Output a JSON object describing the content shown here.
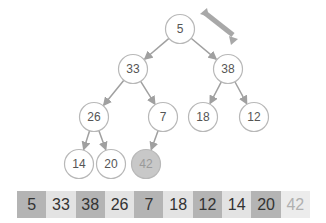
{
  "diagram": {
    "type": "binary-heap",
    "colors": {
      "edge": "#a0a0a0",
      "node_border": "#b8b8b8",
      "node_fill": "#ffffff",
      "highlight_fill": "#c8c8c8",
      "swap_arrow": "#a8a8a8",
      "cell_dark": "#b4b4b4",
      "cell_light": "#e3e3e3",
      "cell_faint": "#ececec"
    },
    "nodes": [
      {
        "id": "n0",
        "value": "5",
        "cx": 180,
        "cy": 29,
        "highlight": false
      },
      {
        "id": "n1",
        "value": "33",
        "cx": 133,
        "cy": 69,
        "highlight": false
      },
      {
        "id": "n2",
        "value": "38",
        "cx": 228,
        "cy": 69,
        "highlight": false
      },
      {
        "id": "n3",
        "value": "26",
        "cx": 94,
        "cy": 117,
        "highlight": false
      },
      {
        "id": "n4",
        "value": "7",
        "cx": 163,
        "cy": 117,
        "highlight": false
      },
      {
        "id": "n5",
        "value": "18",
        "cx": 203,
        "cy": 117,
        "highlight": false
      },
      {
        "id": "n6",
        "value": "12",
        "cx": 254,
        "cy": 117,
        "highlight": false
      },
      {
        "id": "n7",
        "value": "14",
        "cx": 79,
        "cy": 164,
        "highlight": false
      },
      {
        "id": "n8",
        "value": "20",
        "cx": 111,
        "cy": 164,
        "highlight": false
      },
      {
        "id": "n9",
        "value": "42",
        "cx": 146,
        "cy": 164,
        "highlight": true
      }
    ],
    "edges": [
      [
        "n0",
        "n1"
      ],
      [
        "n0",
        "n2"
      ],
      [
        "n1",
        "n3"
      ],
      [
        "n1",
        "n4"
      ],
      [
        "n2",
        "n5"
      ],
      [
        "n2",
        "n6"
      ],
      [
        "n3",
        "n7"
      ],
      [
        "n3",
        "n8"
      ],
      [
        "n4",
        "n9"
      ]
    ],
    "swap_arrow": {
      "between": [
        "5",
        "38"
      ]
    },
    "array": [
      {
        "value": "5",
        "shade": "dark"
      },
      {
        "value": "33",
        "shade": "light"
      },
      {
        "value": "38",
        "shade": "dark"
      },
      {
        "value": "26",
        "shade": "light"
      },
      {
        "value": "7",
        "shade": "dark"
      },
      {
        "value": "18",
        "shade": "light"
      },
      {
        "value": "12",
        "shade": "dark"
      },
      {
        "value": "14",
        "shade": "light"
      },
      {
        "value": "20",
        "shade": "dark"
      },
      {
        "value": "42",
        "shade": "faint"
      }
    ]
  }
}
